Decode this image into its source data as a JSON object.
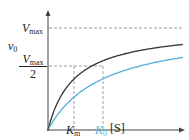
{
  "chart_data": {
    "type": "line",
    "title": "",
    "xlabel": "[S]",
    "ylabel": "v0",
    "y_ticks": [
      {
        "label": "Vmax",
        "value": 1.0
      },
      {
        "label": "Vmax/2",
        "value": 0.5
      }
    ],
    "x_ticks": [
      {
        "label": "Km",
        "value": 1.0,
        "color": "#222222"
      },
      {
        "label": "K0",
        "value": 2.1,
        "color": "#4fb3d9"
      }
    ],
    "series": [
      {
        "name": "Michaelis-Menten (Km)",
        "color": "#333333",
        "km": 1.0,
        "vmax": 1.0
      },
      {
        "name": "Higher apparent Km (K0)",
        "color": "#4fb3d9",
        "km": 2.1,
        "vmax": 1.0
      }
    ],
    "grid": false,
    "legend": "none",
    "asymptote": {
      "label": "Vmax",
      "style": "dashed"
    }
  },
  "labels": {
    "y_axis": "v",
    "y_axis_sub": "0",
    "vmax": "V",
    "vmax_sub": "max",
    "half_num": "V",
    "half_num_sub": "max",
    "half_den": "2",
    "km": "K",
    "km_sub": "m",
    "k0": "K",
    "k0_sub": "0",
    "x_axis": "[S]"
  },
  "colors": {
    "axis": "#444444",
    "black_curve": "#333333",
    "blue_curve": "#4fb3d9",
    "dash": "#888888"
  }
}
